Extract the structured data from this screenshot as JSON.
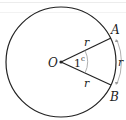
{
  "diagram": {
    "center_label": "O",
    "point_a_label": "A",
    "point_b_label": "B",
    "radius_label_upper": "r",
    "radius_label_lower": "r",
    "arc_label": "r",
    "angle_label": "1",
    "angle_unit_label": "c",
    "colors": {
      "stroke": "#222222",
      "arc_marker": "#9a9a9a",
      "background": "#ffffff"
    }
  }
}
